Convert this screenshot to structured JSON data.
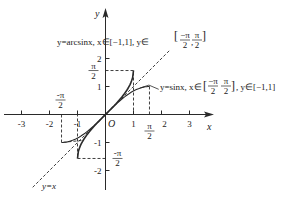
{
  "chart_data": {
    "type": "line",
    "title": "",
    "xlabel": "x",
    "ylabel": "y",
    "origin_label": "O",
    "xlim": [
      -3.5,
      3.8
    ],
    "ylim": [
      -2.7,
      3.7
    ],
    "grid": false,
    "x_ticks": [
      {
        "value": -3,
        "label": "-3"
      },
      {
        "value": -2,
        "label": "-2"
      },
      {
        "value": -1,
        "label": "-1"
      },
      {
        "value": 1,
        "label": "1"
      },
      {
        "value": 2,
        "label": "2"
      },
      {
        "value": 3,
        "label": "3"
      }
    ],
    "y_ticks": [
      {
        "value": 2,
        "label": "2"
      },
      {
        "value": 1,
        "label": "1"
      },
      {
        "value": -1,
        "label": "-1"
      },
      {
        "value": -2,
        "label": "-2"
      }
    ],
    "special_ticks": {
      "x_pi_over_2": {
        "value": 1.5708,
        "label_num": "π",
        "label_den": "2"
      },
      "x_neg_pi_over_2": {
        "value": -1.5708,
        "label_num": "-π",
        "label_den": "2"
      },
      "y_pi_over_2": {
        "value": 1.5708,
        "label_num": "π",
        "label_den": "2"
      },
      "y_neg_pi_over_2": {
        "value": -1.5708,
        "label_num": "-π",
        "label_den": "2"
      }
    },
    "series": [
      {
        "name": "y=sinx",
        "domain": [
          -1.5708,
          1.5708
        ],
        "range": [
          -1,
          1
        ],
        "style": "solid",
        "label": "y=sinx, x∈[−π/2, π/2], y∈[−1,1]"
      },
      {
        "name": "y=arcsinx",
        "domain": [
          -1,
          1
        ],
        "range": [
          -1.5708,
          1.5708
        ],
        "style": "solid",
        "label": "y=arcsinx, x∈[−1,1], y∈[−π/2, π/2]"
      },
      {
        "name": "y=x",
        "style": "dashed",
        "label": "y=x"
      }
    ],
    "annotations": [
      "y=arcsinx, x∈[-1,1], y∈[-π/2, π/2]",
      "y=sinx, x∈[-π/2, π/2], y∈[-1,1]",
      "y=x"
    ]
  },
  "labels": {
    "arcsin_prefix": "y=arcsinx, x∈[−1,1], y∈",
    "sin_prefix": "y=sinx, x∈",
    "sin_suffix": ", y∈[−1,1]",
    "yx": "y=x",
    "pi": "π",
    "two": "2",
    "minus": "−"
  }
}
